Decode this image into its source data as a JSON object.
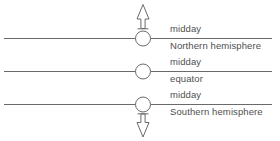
{
  "diagram": {
    "colors": {
      "stroke": "#6a6a6a",
      "text": "#4f4f4f",
      "background": "#ffffff",
      "circle_fill": "#ffffff"
    },
    "rows": [
      {
        "id": "northern-hemisphere",
        "label_above": "midday",
        "label_below": "Northern hemisphere",
        "arrow": "up-arrow-icon",
        "observer": "observer-circle"
      },
      {
        "id": "equator",
        "label_above": "midday",
        "label_below": "equator",
        "arrow": "none",
        "observer": "observer-circle"
      },
      {
        "id": "southern-hemisphere",
        "label_above": "midday",
        "label_below": "Southern hemisphere",
        "arrow": "down-arrow-icon",
        "observer": "observer-circle"
      }
    ]
  }
}
